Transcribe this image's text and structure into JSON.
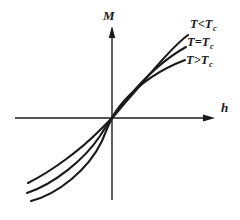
{
  "figure": {
    "name": "magnetization-vs-field-diagram",
    "background_color": "#ffffff",
    "ink_color": "#1a1a1a"
  },
  "axes": {
    "vertical": {
      "label": "M",
      "label_icon": "vertical-axis-arrow",
      "x": 112,
      "y_top": 28,
      "y_bottom": 200,
      "label_x": 103,
      "label_y": 20
    },
    "horizontal": {
      "label": "h",
      "label_icon": "horizontal-axis-arrow",
      "y": 118,
      "x_left": 15,
      "x_right": 215,
      "label_x": 221,
      "label_y": 112
    }
  },
  "chart_data": {
    "type": "line",
    "title": "",
    "xlabel": "h",
    "ylabel": "M",
    "grid": false,
    "legend_position": "right-inline",
    "origin": {
      "x": 112,
      "y": 118
    },
    "series": [
      {
        "name": "T<Tc",
        "label_text": "T<T",
        "label_sub": "c",
        "label_x": 190,
        "label_y": 28,
        "description": "steepest rise, highest saturation",
        "path": "M 28 183 C 52 171, 80 150, 98 132 C 104 126, 109 121, 112 118 C 116 114, 122 106, 131 96 C 148 77, 168 50, 188 35"
      },
      {
        "name": "T=Tc",
        "label_text": "T=T",
        "label_sub": "c",
        "label_x": 187,
        "label_y": 46,
        "description": "critical isotherm, intermediate saturation",
        "path": "M 27 193 C 54 184, 84 160, 100 136 C 105 128, 109 122, 112 118 C 115 114, 120 107, 127 99 C 145 77, 166 58, 186 47"
      },
      {
        "name": "T>Tc",
        "label_text": "T>T",
        "label_sub": "c",
        "label_x": 186,
        "label_y": 64,
        "description": "shallowest rise, lowest saturation",
        "path": "M 31 201 C 58 194, 88 170, 102 141 C 106 131, 110 122, 112 118 C 114 114, 118 108, 124 101 C 142 81, 164 68, 185 60"
      }
    ]
  }
}
